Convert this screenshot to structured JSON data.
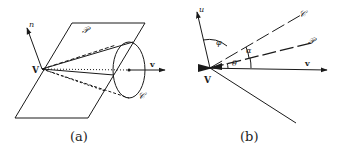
{
  "figure_a": {
    "caption": "(a)",
    "labels": {
      "normal": "n",
      "plane": "𝒫",
      "vertex": "V",
      "velocity": "v",
      "cone": "𝒞"
    }
  },
  "figure_b": {
    "caption": "(b)",
    "labels": {
      "normal": "u",
      "cone": "𝒞",
      "plane": "𝒫",
      "vertex": "V",
      "velocity": "v",
      "phi": "φ",
      "alpha": "α",
      "theta": "θ"
    }
  },
  "colors": {
    "ink": "#1a1a1a",
    "background": "#ffffff"
  }
}
